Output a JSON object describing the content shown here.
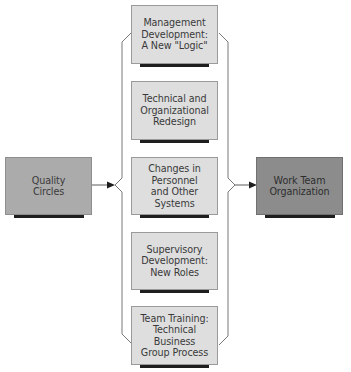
{
  "diagram": {
    "source": {
      "label": "Quality\nCircles",
      "fill": "#ababab"
    },
    "target": {
      "label": "Work Team\nOrganization",
      "fill": "#8c8c8c"
    },
    "components": [
      {
        "label": "Management\nDevelopment:\nA New \"Logic\""
      },
      {
        "label": "Technical and\nOrganizational\nRedesign"
      },
      {
        "label": "Changes in\nPersonnel\nand Other\nSystems"
      },
      {
        "label": "Supervisory\nDevelopment:\nNew Roles"
      },
      {
        "label": "Team Training:\nTechnical\nBusiness\nGroup Process"
      }
    ],
    "colors": {
      "component_fill": "#dedede",
      "shadow": "#1e1e1e",
      "connector": "#6a6a6a"
    }
  }
}
